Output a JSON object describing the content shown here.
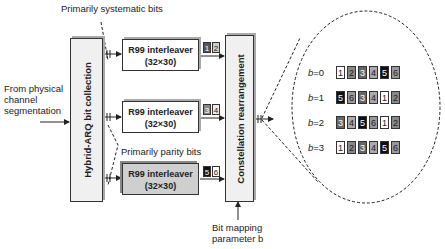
{
  "labels": {
    "top": "Primarily systematic bits",
    "input": [
      "From physical",
      "channel",
      "segmentation"
    ],
    "parity": "Primarily parity bits",
    "param": [
      "Bit mapping",
      "parameter b"
    ]
  },
  "blocks": {
    "hybrid": "Hybrid-ARQ bit collection",
    "constellation": "Constellation rearrangement",
    "interleavers": [
      {
        "title": "R99 interleaver",
        "size": "(32×30)",
        "tag": [
          "1",
          "2"
        ]
      },
      {
        "title": "R99 interleaver",
        "size": "(32×30)",
        "tag": [
          "3",
          "4"
        ]
      },
      {
        "title": "R99 interleaver",
        "size": "(32×30)",
        "tag": [
          "5",
          "6"
        ]
      }
    ]
  },
  "mapping": [
    {
      "b": "b=0",
      "cells": [
        "1",
        "2",
        "3",
        "4",
        "5",
        "6"
      ],
      "shades": [
        "#fff",
        "#888",
        "#666",
        "#aaa",
        "#111",
        "#999"
      ]
    },
    {
      "b": "b=1",
      "cells": [
        "5",
        "6",
        "3",
        "4",
        "1",
        "2"
      ],
      "shades": [
        "#111",
        "#999",
        "#666",
        "#aaa",
        "#fff",
        "#888"
      ]
    },
    {
      "b": "b=2",
      "cells": [
        "3",
        "4",
        "5",
        "6",
        "1",
        "2"
      ],
      "shades": [
        "#666",
        "#aaa",
        "#111",
        "#999",
        "#fff",
        "#888"
      ]
    },
    {
      "b": "b=3",
      "cells": [
        "1",
        "2",
        "3",
        "4",
        "5",
        "6"
      ],
      "shades": [
        "#fff",
        "#888",
        "#666",
        "#aaa",
        "#111",
        "#999"
      ]
    }
  ],
  "tag_shades": [
    [
      "#555",
      "#ccc"
    ],
    [
      "#888",
      "#eee"
    ],
    [
      "#111",
      "#fff"
    ]
  ]
}
